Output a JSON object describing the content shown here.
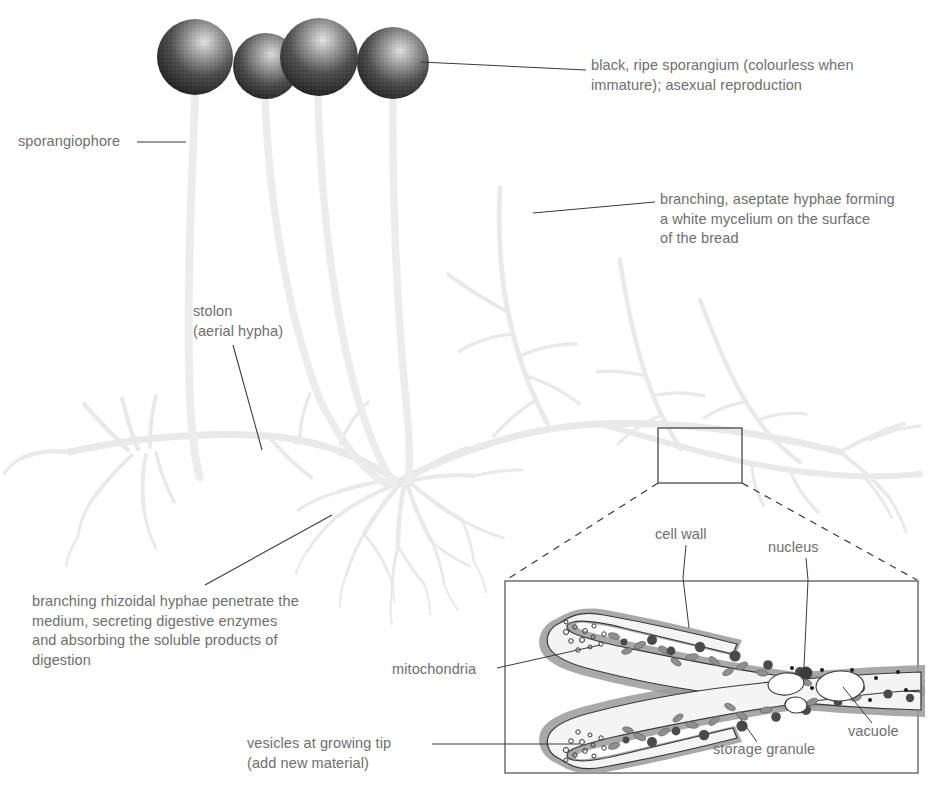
{
  "diagram": {
    "background_color": "#ffffff",
    "text_color": "#6e6e6e",
    "leader_line_color": "#3b3b3b",
    "hypha_color": "#e9e9e9",
    "sporangium_dark": "#2b2b2b",
    "sporangium_light": "#d8d8d8",
    "inset_border_color": "#4a4a4a",
    "cell_wall_color": "#9a9a9a",
    "cytoplasm_color": "#f4f4f4",
    "organelle_dark": "#4e4e4e",
    "organelle_mid": "#8c8c8c"
  },
  "labels": {
    "sporangium": "black, ripe sporangium (colourless when\nimmature); asexual reproduction",
    "sporangiophore": "sporangiophore",
    "mycelium": "branching, aseptate hyphae forming\na white mycelium on the surface\nof the bread",
    "stolon": "stolon\n(aerial hypha)",
    "rhizoids": "branching rhizoidal hyphae penetrate the\nmedium, secreting digestive enzymes\nand absorbing the soluble products of\ndigestion"
  },
  "inset": {
    "name": "hypha cell structure detail",
    "labels": {
      "cell_wall": "cell wall",
      "nucleus": "nucleus",
      "vacuole": "vacuole",
      "mitochondria": "mitochondria",
      "storage_granule": "storage granule",
      "vesicles": "vesicles at growing tip\n(add new material)"
    }
  },
  "structures": {
    "sporangia_count": 4,
    "sporangiophore_count": 4,
    "organelles": [
      "vesicle",
      "mitochondrion",
      "storage granule",
      "nucleus",
      "vacuole",
      "cell wall"
    ]
  }
}
